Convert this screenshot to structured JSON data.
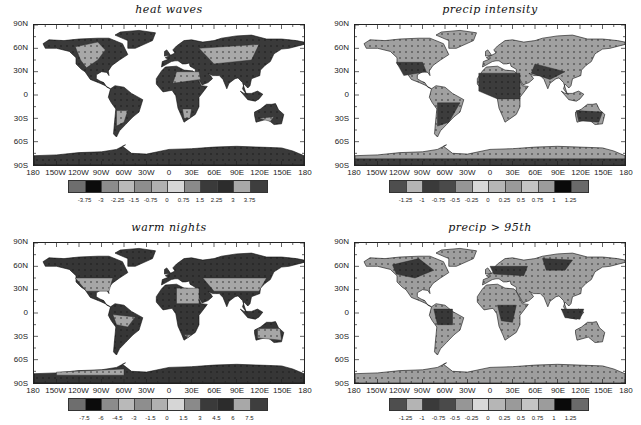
{
  "chart_data": [
    {
      "type": "heatmap",
      "title": "heat waves",
      "xlabel": "",
      "ylabel": "",
      "xticks": [
        "180",
        "150W",
        "120W",
        "90W",
        "60W",
        "30W",
        "0",
        "30E",
        "60E",
        "90E",
        "120E",
        "150E",
        "180"
      ],
      "yticks": [
        "90N",
        "60N",
        "30N",
        "0",
        "30S",
        "60S",
        "90S"
      ],
      "colorbar": {
        "labels": [
          "-3.75",
          "-3",
          "-2.25",
          "-1.5",
          "-0.75",
          "0",
          "0.75",
          "1.5",
          "2.25",
          "3",
          "3.75"
        ],
        "colors": [
          "#6e6e6e",
          "#0c0c0c",
          "#8c8c8c",
          "#b9b9b9",
          "#8e8e8e",
          "#b0b0b0",
          "#d6d6d6",
          "#8a8a8a",
          "#3a3a3a",
          "#2c2c2c",
          "#a8a8a8",
          "#3e3e3e"
        ]
      },
      "stippling": true,
      "land_fill": "#3a3a3a",
      "highlight_fill": "#a8a8a8"
    },
    {
      "type": "heatmap",
      "title": "precip intensity",
      "xlabel": "",
      "ylabel": "",
      "xticks": [
        "180",
        "150W",
        "120W",
        "90W",
        "60W",
        "30W",
        "0",
        "30E",
        "60E",
        "90E",
        "120E",
        "150E",
        "180"
      ],
      "yticks": [
        "90N",
        "60N",
        "30N",
        "0",
        "30S",
        "60S",
        "90S"
      ],
      "colorbar": {
        "labels": [
          "-1.25",
          "-1",
          "-0.75",
          "-0.5",
          "-0.25",
          "0",
          "0.25",
          "0.5",
          "0.75",
          "1",
          "1.25"
        ],
        "colors": [
          "#4e4e4e",
          "#b4b4b4",
          "#3a3a3a",
          "#4a4a4a",
          "#969696",
          "#d8d8d8",
          "#b6b6b6",
          "#9a9a9a",
          "#c4c4c4",
          "#9c9c9c",
          "#0a0a0a",
          "#6a6a6a"
        ]
      },
      "stippling": true,
      "land_fill": "#a0a0a0",
      "highlight_fill": "#3c3c3c"
    },
    {
      "type": "heatmap",
      "title": "warm nights",
      "xlabel": "",
      "ylabel": "",
      "xticks": [
        "180",
        "150W",
        "120W",
        "90W",
        "60W",
        "30W",
        "0",
        "30E",
        "60E",
        "90E",
        "120E",
        "150E",
        "180"
      ],
      "yticks": [
        "90N",
        "60N",
        "30N",
        "0",
        "30S",
        "60S",
        "90S"
      ],
      "colorbar": {
        "labels": [
          "-7.5",
          "-6",
          "-4.5",
          "-3",
          "-1.5",
          "0",
          "1.5",
          "3",
          "4.5",
          "6",
          "7.5"
        ],
        "colors": [
          "#6e6e6e",
          "#0c0c0c",
          "#8c8c8c",
          "#b9b9b9",
          "#8e8e8e",
          "#b0b0b0",
          "#d6d6d6",
          "#8a8a8a",
          "#3a3a3a",
          "#2c2c2c",
          "#a8a8a8",
          "#3e3e3e"
        ]
      },
      "stippling": true,
      "land_fill": "#363636",
      "highlight_fill": "#a6a6a6"
    },
    {
      "type": "heatmap",
      "title": "precip > 95th",
      "xlabel": "",
      "ylabel": "",
      "xticks": [
        "180",
        "150W",
        "120W",
        "90W",
        "60W",
        "30W",
        "0",
        "30E",
        "60E",
        "90E",
        "120E",
        "150E",
        "180"
      ],
      "yticks": [
        "90N",
        "60N",
        "30N",
        "0",
        "30S",
        "60S",
        "90S"
      ],
      "colorbar": {
        "labels": [
          "-1.25",
          "-1",
          "-0.75",
          "-0.5",
          "-0.25",
          "0",
          "0.25",
          "0.5",
          "0.75",
          "1",
          "1.25"
        ],
        "colors": [
          "#4e4e4e",
          "#b4b4b4",
          "#3a3a3a",
          "#4a4a4a",
          "#969696",
          "#d8d8d8",
          "#b6b6b6",
          "#9a9a9a",
          "#c4c4c4",
          "#9c9c9c",
          "#0a0a0a",
          "#6a6a6a"
        ]
      },
      "stippling": true,
      "land_fill": "#9e9e9e",
      "highlight_fill": "#383838"
    }
  ]
}
